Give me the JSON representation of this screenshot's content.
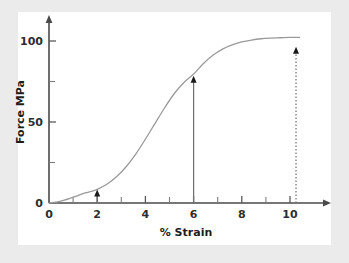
{
  "chart_data": {
    "type": "line",
    "title": "",
    "xlabel": "% Strain",
    "ylabel": "Force MPa",
    "xlim": [
      0,
      10.6
    ],
    "ylim": [
      0,
      110
    ],
    "grid": false,
    "legend": "none",
    "x_ticks_major": [
      0,
      2,
      4,
      6,
      8,
      10
    ],
    "x_tick_labels": [
      "0",
      "2",
      "4",
      "6",
      "8",
      "10"
    ],
    "x_ticks_minor": [
      1,
      3,
      5,
      7,
      9
    ],
    "y_ticks_major": [
      0,
      50,
      100
    ],
    "y_tick_labels": [
      "0",
      "50",
      "100"
    ],
    "y_ticks_minor": [
      25,
      75
    ],
    "series": [
      {
        "name": "Force vs Strain",
        "x": [
          0,
          0.3,
          0.6,
          0.9,
          1.2,
          1.5,
          1.8,
          2.0,
          2.4,
          2.8,
          3.2,
          3.6,
          4.0,
          4.4,
          4.8,
          5.2,
          5.6,
          6.0,
          6.4,
          6.8,
          7.2,
          7.6,
          8.0,
          8.4,
          8.8,
          9.2,
          9.6,
          10.0,
          10.4
        ],
        "y": [
          0,
          0.6,
          1.6,
          3.0,
          4.6,
          6.2,
          7.4,
          8.4,
          11.6,
          16.2,
          22.4,
          30.2,
          39.4,
          49.2,
          58.8,
          67.6,
          74.4,
          79.6,
          86.0,
          91.2,
          95.0,
          97.6,
          99.4,
          100.6,
          101.4,
          101.8,
          102.0,
          102.2,
          102.2
        ]
      }
    ],
    "annotations": [
      {
        "name": "arrow-low-strain",
        "x": 2.0,
        "y_from": 0,
        "y_to": 8.4,
        "style": "solid",
        "arrowhead": "up"
      },
      {
        "name": "arrow-mid-strain",
        "x": 6.0,
        "y_from": 0,
        "y_to": 78.5,
        "style": "solid",
        "arrowhead": "up"
      },
      {
        "name": "arrow-high-strain",
        "x": 10.25,
        "y_from": 0,
        "y_to": 96.5,
        "style": "dotted",
        "arrowhead": "up"
      }
    ]
  },
  "colors": {
    "page_background": "#ebebeb",
    "plot_background": "#ffffff",
    "axis": "#4a4a4a",
    "curve": "#9a9a9a",
    "annotation": "#1a1a1a",
    "text": "#1d1d1d"
  }
}
